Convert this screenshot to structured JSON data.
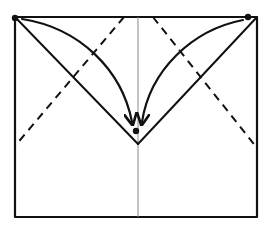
{
  "diagram": {
    "type": "origami-fold-step",
    "colors": {
      "background": "#ffffff",
      "ink": "#111111",
      "centerline": "#888888"
    },
    "paper": {
      "left": 15,
      "top": 17,
      "right": 257,
      "bottom": 217
    },
    "center_crease": {
      "x": 138,
      "y1": 17,
      "y2": 217
    },
    "dashed_fold_lines": [
      {
        "name": "left-valley-fold",
        "x1": 124,
        "y1": 17,
        "x2": 15,
        "y2": 146
      },
      {
        "name": "right-valley-fold",
        "x1": 153,
        "y1": 17,
        "x2": 257,
        "y2": 148
      }
    ],
    "solid_v_lines": [
      {
        "name": "left-v-edge",
        "x1": 15,
        "y1": 17,
        "x2": 138,
        "y2": 144
      },
      {
        "name": "right-v-edge",
        "x1": 257,
        "y1": 17,
        "x2": 138,
        "y2": 144
      }
    ],
    "reference_dots": [
      {
        "name": "top-left-corner-dot",
        "x": 15,
        "y": 18
      },
      {
        "name": "top-right-corner-dot",
        "x": 248,
        "y": 17
      },
      {
        "name": "target-center-dot",
        "x": 136,
        "y": 131
      }
    ],
    "arrows": [
      {
        "name": "left-fold-arrow",
        "path": "M22 19 C 80 28, 122 70, 132 122"
      },
      {
        "name": "right-fold-arrow",
        "path": "M243 20 C 192 30, 150 70, 142 122"
      }
    ]
  }
}
